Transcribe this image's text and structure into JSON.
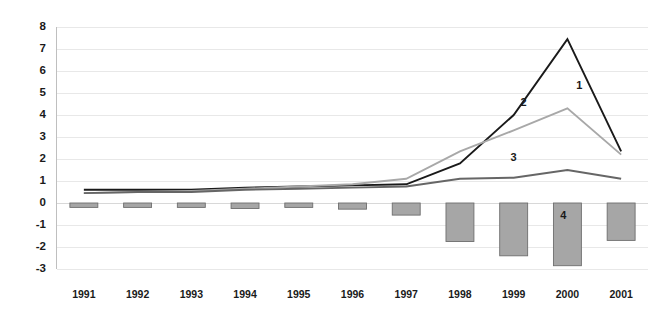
{
  "chart_data": {
    "type": "line",
    "title": "",
    "subtitle": "",
    "xlabel": "",
    "ylabel": "",
    "categories": [
      "1991",
      "1992",
      "1993",
      "1994",
      "1995",
      "1996",
      "1997",
      "1998",
      "1999",
      "2000",
      "2001"
    ],
    "ylim": [
      -3,
      8
    ],
    "yticks": [
      8,
      7,
      6,
      5,
      4,
      3,
      2,
      1,
      0,
      -1,
      -2,
      -3
    ],
    "ytick_labels": [
      "8",
      "7",
      "6",
      "5",
      "4",
      "3",
      "2",
      "1",
      "0",
      "-1",
      "-2",
      "-3"
    ],
    "grid": true,
    "legend": "inline-endpoint-labels",
    "series": [
      {
        "name": "1",
        "type": "line",
        "color": "#1a1a1a",
        "label": "1",
        "label_x": "2000",
        "label_value": 5.3,
        "values": [
          0.6,
          0.6,
          0.6,
          0.7,
          0.75,
          0.8,
          0.85,
          1.8,
          4.0,
          7.45,
          2.35
        ]
      },
      {
        "name": "2",
        "type": "line",
        "color": "#a8a8a8",
        "label": "2",
        "label_x": "1999",
        "label_value": 4.55,
        "values": [
          0.45,
          0.5,
          0.55,
          0.65,
          0.75,
          0.85,
          1.1,
          2.35,
          3.3,
          4.3,
          2.2
        ]
      },
      {
        "name": "3",
        "type": "line",
        "color": "#666666",
        "label": "3",
        "label_x": "1999",
        "label_value": 2.05,
        "values": [
          0.45,
          0.5,
          0.5,
          0.6,
          0.65,
          0.7,
          0.75,
          1.1,
          1.15,
          1.5,
          1.1
        ]
      },
      {
        "name": "4",
        "type": "bar",
        "color": "#a6a6a6",
        "edge_color": "#6e6e6e",
        "label": "4",
        "label_x": "2000",
        "label_value": -0.6,
        "values": [
          -0.2,
          -0.2,
          -0.2,
          -0.25,
          -0.2,
          -0.28,
          -0.55,
          -1.75,
          -2.4,
          -2.85,
          -1.7
        ]
      }
    ]
  }
}
